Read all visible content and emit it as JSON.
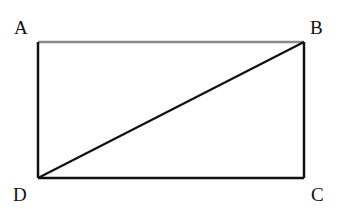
{
  "diagram": {
    "type": "rectangle-with-diagonal",
    "labels": {
      "A": "A",
      "B": "B",
      "C": "C",
      "D": "D"
    },
    "vertices": {
      "A": {
        "x": 38,
        "y": 42
      },
      "B": {
        "x": 304,
        "y": 42
      },
      "C": {
        "x": 304,
        "y": 178
      },
      "D": {
        "x": 38,
        "y": 178
      }
    },
    "edges": [
      {
        "from": "A",
        "to": "B",
        "color": "#8a8a8a"
      },
      {
        "from": "B",
        "to": "C",
        "color": "#111111"
      },
      {
        "from": "C",
        "to": "D",
        "color": "#111111"
      },
      {
        "from": "D",
        "to": "A",
        "color": "#111111"
      }
    ],
    "diagonal": {
      "from": "D",
      "to": "B",
      "color": "#111111"
    }
  }
}
